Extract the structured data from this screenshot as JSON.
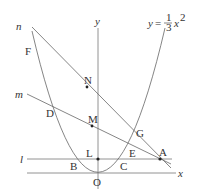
{
  "diagram": {
    "equation": {
      "lhs": "y",
      "eq": "=",
      "numerator": "1",
      "denominator": "3",
      "var": "x",
      "exp": "2"
    },
    "axes": {
      "x_label": "x",
      "y_label": "y",
      "origin_label": "O"
    },
    "lines": {
      "l": "l",
      "m": "m",
      "n": "n"
    },
    "points": {
      "A": "A",
      "B": "B",
      "C": "C",
      "D": "D",
      "E": "E",
      "F": "F",
      "G": "G",
      "L": "L",
      "M": "M",
      "N": "N"
    },
    "colors": {
      "stroke": "#555555",
      "text": "#333333",
      "background": "#ffffff"
    }
  }
}
